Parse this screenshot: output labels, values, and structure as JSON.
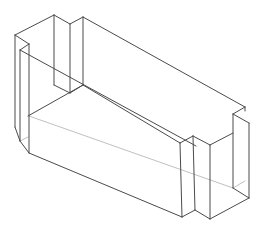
{
  "drawing": {
    "title": "Isometric wireframe of rectangular block with notched end posts",
    "stroke_color": "#4a4a4a",
    "hidden_stroke_color": "#b0b0b0",
    "background": "#ffffff",
    "edges": [
      [
        15,
        35,
        54,
        15
      ],
      [
        54,
        15,
        70,
        24
      ],
      [
        70,
        24,
        83,
        17
      ],
      [
        83,
        17,
        245,
        107
      ],
      [
        15,
        35,
        15,
        127
      ],
      [
        54,
        15,
        54,
        85
      ],
      [
        70,
        24,
        70,
        93
      ],
      [
        83,
        17,
        83,
        85
      ],
      [
        15,
        35,
        29,
        44
      ],
      [
        29,
        44,
        29,
        153
      ],
      [
        29,
        44,
        20,
        50
      ],
      [
        20,
        50,
        20,
        141
      ],
      [
        20,
        141,
        29,
        153
      ],
      [
        15,
        127,
        20,
        141
      ],
      [
        20,
        50,
        196,
        146
      ],
      [
        54,
        85,
        70,
        93
      ],
      [
        70,
        93,
        83,
        85
      ],
      [
        83,
        85,
        28,
        116
      ],
      [
        245,
        107,
        233,
        114
      ],
      [
        233,
        114,
        249,
        123
      ],
      [
        249,
        123,
        249,
        198
      ],
      [
        245,
        107,
        245,
        111
      ],
      [
        233,
        114,
        233,
        188
      ],
      [
        233,
        188,
        249,
        198
      ],
      [
        249,
        198,
        210,
        219
      ],
      [
        210,
        219,
        195,
        210
      ],
      [
        195,
        210,
        182,
        217
      ],
      [
        182,
        217,
        29,
        153
      ],
      [
        180,
        143,
        193,
        136
      ],
      [
        193,
        136,
        210,
        145
      ],
      [
        210,
        145,
        233,
        133
      ],
      [
        180,
        143,
        182,
        217
      ],
      [
        193,
        136,
        195,
        210
      ],
      [
        210,
        145,
        210,
        219
      ],
      [
        83,
        85,
        180,
        143
      ]
    ],
    "hidden_edges": [
      [
        29,
        116,
        233,
        188
      ],
      [
        20,
        141,
        28,
        137
      ],
      [
        233,
        188,
        245,
        181
      ]
    ]
  }
}
